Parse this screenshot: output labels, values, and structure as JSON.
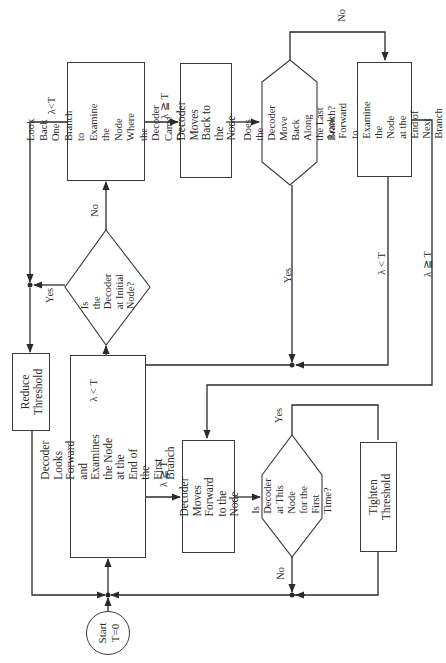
{
  "diagram": {
    "orientation": "rotated-90-ccw",
    "nodes": {
      "start": {
        "label": "Start\nT=0"
      },
      "look_forward_first": {
        "label": "Decoder\nLooks Forward and\nExamines the Node\nat the End of the\nFirst Branch"
      },
      "reduce_threshold": {
        "label": "Reduce\nThreshold"
      },
      "initial_node_q": {
        "label": "Is\nthe Decoder\nat Initial\nNode?"
      },
      "look_back": {
        "label": "Look Back One\nBranch to Examine\nthe Node Where\nthe Decoder Came\nFrom"
      },
      "moves_back": {
        "label": "Decoder\nMoves Back to\nthe Node"
      },
      "move_back_last_q": {
        "label": "Does the Decoder\nMove Back Along\nthe Last Branch?"
      },
      "look_forward_next": {
        "label": "Look Forward to\nExamine the Node\nat the End of Next\nBranch"
      },
      "moves_forward": {
        "label": "Decoder\nMoves Forward\nto the Node"
      },
      "first_time_q": {
        "label": "Is\nDecoder at This\nNode for the\nFirst Time?"
      },
      "tighten_threshold": {
        "label": "Tighten\nThreshold"
      }
    },
    "edge_labels": {
      "lt_first": "λ < T",
      "ge_first": "λ ≧ T",
      "yes_initial": "Yes",
      "no_initial": "No",
      "lt_lookback": "λ<T",
      "ge_lookback": "λ ≧ T",
      "no_moveback": "No",
      "yes_moveback": "Yes",
      "lt_next": "λ < T",
      "ge_next": "λ ≧ T",
      "yes_first_time": "Yes",
      "no_first_time": "No"
    }
  }
}
